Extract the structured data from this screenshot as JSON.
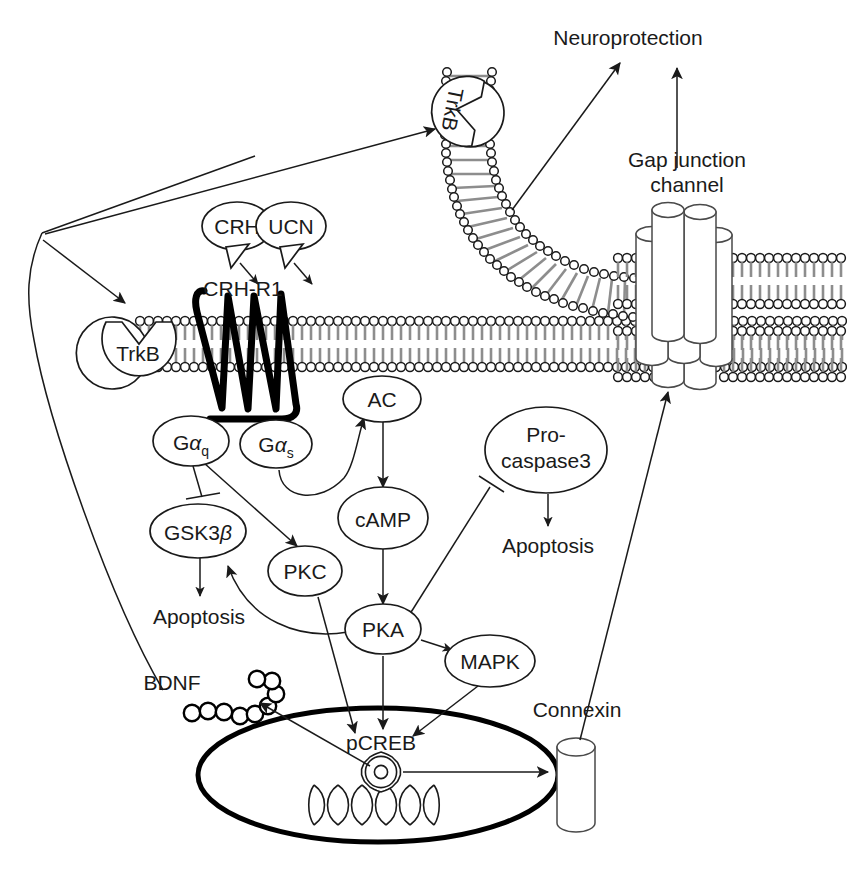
{
  "diagram": {
    "background": "#ffffff",
    "ink": "#1a1a1a",
    "membrane_tail_color": "#8d8d8d"
  },
  "labels": {
    "neuroprotection": "Neuroprotection",
    "gap_junction_line1": "Gap junction",
    "gap_junction_line2": "channel",
    "connexin": "Connexin",
    "bdnf": "BDNF",
    "crh": "CRH",
    "ucn": "UCN",
    "crh_r1": "CRH-R1",
    "trkb_upper": "TrkB",
    "trkb_lower": "TrkB",
    "apoptosis_left": "Apoptosis",
    "apoptosis_right": "Apoptosis",
    "pcreb": "pCREB"
  },
  "nodes": [
    {
      "id": "crh",
      "label": "CRH",
      "shape": "callout-ellipse",
      "cx": 237,
      "cy": 226
    },
    {
      "id": "ucn",
      "label": "UCN",
      "shape": "callout-ellipse",
      "cx": 289,
      "cy": 226
    },
    {
      "id": "ac",
      "label": "AC",
      "shape": "ellipse",
      "cx": 382,
      "cy": 399
    },
    {
      "id": "gaq",
      "label": "G",
      "sub": "q",
      "greek": "α",
      "shape": "ellipse",
      "cx": 191,
      "cy": 441
    },
    {
      "id": "gas",
      "label": "G",
      "sub": "s",
      "greek": "α",
      "shape": "ellipse",
      "cx": 276,
      "cy": 444
    },
    {
      "id": "procaspase3",
      "label": "Pro-caspase3",
      "line1": "Pro-",
      "line2": "caspase3",
      "shape": "ellipse",
      "cx": 546,
      "cy": 450
    },
    {
      "id": "gsk3b",
      "label": "GSK3",
      "greek": "β",
      "shape": "ellipse",
      "cx": 198,
      "cy": 531
    },
    {
      "id": "camp",
      "label": "cAMP",
      "shape": "ellipse",
      "cx": 383,
      "cy": 518
    },
    {
      "id": "pkc",
      "label": "PKC",
      "shape": "ellipse",
      "cx": 305,
      "cy": 571
    },
    {
      "id": "pka",
      "label": "PKA",
      "shape": "ellipse",
      "cx": 383,
      "cy": 629
    },
    {
      "id": "mapk",
      "label": "MAPK",
      "shape": "ellipse",
      "cx": 490,
      "cy": 661
    },
    {
      "id": "pcreb",
      "label": "pCREB",
      "shape": "text",
      "cx": 381,
      "cy": 750
    }
  ],
  "edges": [
    {
      "from": "bdnf",
      "to": "trkb-upper",
      "type": "arrow",
      "note": "secreted BDNF to presynaptic TrkB"
    },
    {
      "from": "cell-corner",
      "to": "trkb-lower",
      "type": "arrow",
      "note": "BDNF to autocrine TrkB"
    },
    {
      "from": "trkb-upper",
      "to": "neuroprotection",
      "type": "arrow"
    },
    {
      "from": "gap-junction",
      "to": "neuroprotection",
      "type": "arrow"
    },
    {
      "from": "crh",
      "to": "crh-r1",
      "type": "callout"
    },
    {
      "from": "ucn",
      "to": "crh-r1",
      "type": "callout"
    },
    {
      "from": "gas",
      "to": "ac",
      "type": "curved-arrow"
    },
    {
      "from": "ac",
      "to": "camp",
      "type": "arrow"
    },
    {
      "from": "camp",
      "to": "pka",
      "type": "arrow"
    },
    {
      "from": "gaq",
      "to": "gsk3b",
      "type": "inhibition"
    },
    {
      "from": "gaq",
      "to": "pkc",
      "type": "arrow"
    },
    {
      "from": "gsk3b",
      "to": "apoptosis-left",
      "type": "arrow"
    },
    {
      "from": "pka",
      "to": "gsk3b",
      "type": "curved-arrow"
    },
    {
      "from": "pka",
      "to": "procaspase3",
      "type": "inhibition"
    },
    {
      "from": "procaspase3",
      "to": "apoptosis-right",
      "type": "arrow"
    },
    {
      "from": "pka",
      "to": "mapk",
      "type": "arrow"
    },
    {
      "from": "pka",
      "to": "pcreb",
      "type": "arrow"
    },
    {
      "from": "pkc",
      "to": "pcreb",
      "type": "arrow"
    },
    {
      "from": "mapk",
      "to": "pcreb",
      "type": "arrow"
    },
    {
      "from": "nucleus-gear",
      "to": "bdnf",
      "type": "arrow"
    },
    {
      "from": "nucleus-gear",
      "to": "connexin",
      "type": "arrow"
    },
    {
      "from": "connexin",
      "to": "gap-junction",
      "type": "arrow"
    }
  ],
  "structures": [
    {
      "id": "membrane-lower",
      "kind": "lipid-bilayer",
      "orientation": "horizontal"
    },
    {
      "id": "membrane-upper",
      "kind": "lipid-bilayer",
      "orientation": "curved"
    },
    {
      "id": "membrane-gap-top",
      "kind": "lipid-bilayer",
      "orientation": "horizontal"
    },
    {
      "id": "membrane-gap-bottom",
      "kind": "lipid-bilayer",
      "orientation": "horizontal"
    },
    {
      "id": "connexon-bundle",
      "kind": "cylinder-cluster",
      "count": 8
    },
    {
      "id": "connexin-monomer",
      "kind": "cylinder",
      "count": 1
    },
    {
      "id": "crh-r1-receptor",
      "kind": "seven-transmembrane-serpentine"
    },
    {
      "id": "bdnf-chain",
      "kind": "bead-chain",
      "count": 10
    },
    {
      "id": "nucleus",
      "kind": "ellipse"
    },
    {
      "id": "dna-helix",
      "kind": "double-helix",
      "turns": 7
    },
    {
      "id": "creb-gear",
      "kind": "cog"
    }
  ]
}
